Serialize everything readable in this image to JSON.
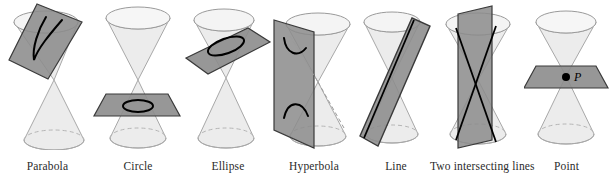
{
  "figure": {
    "colors": {
      "cone_fill": "#ececec",
      "cone_fill_dark": "#e0e0e0",
      "cone_stroke": "#a8a8a8",
      "cone_rim_stroke": "#8f8f8f",
      "plane_fill": "#8c8c8c",
      "plane_fill_light": "#9a9a9a",
      "plane_stroke": "#3a3a3a",
      "curve_stroke": "#000000",
      "label_color": "#2b2b2b",
      "background": "#ffffff",
      "point_marker": "#000000"
    },
    "panels": [
      {
        "id": "parabola",
        "label": "Parabola",
        "section_type": "parabola",
        "plane_orientation": "tilted-parallel-to-one-generator",
        "curve_description": "open U-shaped curve cutting one nappe",
        "nappes_cut": 1,
        "point_label": ""
      },
      {
        "id": "circle",
        "label": "Circle",
        "section_type": "circle",
        "plane_orientation": "horizontal-perpendicular-to-axis",
        "curve_description": "closed circular curve on lower nappe",
        "nappes_cut": 1,
        "point_label": ""
      },
      {
        "id": "ellipse",
        "label": "Ellipse",
        "section_type": "ellipse",
        "plane_orientation": "tilted-oblique-to-axis",
        "curve_description": "closed oval curve on upper nappe",
        "nappes_cut": 1,
        "point_label": ""
      },
      {
        "id": "hyperbola",
        "label": "Hyperbola",
        "section_type": "hyperbola",
        "plane_orientation": "vertical-parallel-to-axis",
        "curve_description": "two opposing open branches, one on each nappe",
        "nappes_cut": 2,
        "point_label": ""
      },
      {
        "id": "line",
        "label": "Line",
        "section_type": "degenerate-line",
        "plane_orientation": "tangent-to-cone-surface",
        "curve_description": "single straight line along a generator",
        "nappes_cut": 2,
        "point_label": ""
      },
      {
        "id": "two-intersecting-lines",
        "label": "Two intersecting lines",
        "section_type": "degenerate-two-lines",
        "plane_orientation": "vertical-through-apex",
        "curve_description": "two straight lines crossing at the apex",
        "nappes_cut": 2,
        "point_label": ""
      },
      {
        "id": "point",
        "label": "Point",
        "section_type": "degenerate-point",
        "plane_orientation": "horizontal-through-apex",
        "curve_description": "single point at the apex",
        "nappes_cut": 0,
        "point_label": "P"
      }
    ]
  }
}
